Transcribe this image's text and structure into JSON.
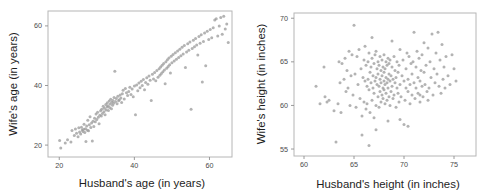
{
  "figure": {
    "kind": "two-panel-scatterplot-figure",
    "background": "#ffffff",
    "point_color": "#9a9a9a",
    "frame_color": "#b6b6b6",
    "tick_color": "#8f8f8f",
    "text_color": "#1d1d1d"
  },
  "chart_data": [
    {
      "type": "scatter",
      "panel": "left",
      "title": "",
      "xlabel": "Husband's age (in years)",
      "ylabel": "Wife's age (in years)",
      "xticks": [
        20,
        40,
        60
      ],
      "yticks": [
        20,
        40,
        60
      ],
      "xlim": [
        17,
        66
      ],
      "ylim": [
        16,
        65
      ],
      "grid": false,
      "legend": false,
      "n_points": 170,
      "x": [
        20.1,
        20.4,
        21.6,
        22.2,
        23.1,
        23.4,
        24.0,
        24.3,
        24.6,
        25.0,
        25.2,
        25.4,
        25.7,
        25.9,
        26.1,
        26.3,
        26.5,
        26.6,
        26.8,
        27.0,
        27.1,
        27.3,
        27.5,
        27.6,
        27.8,
        28.0,
        28.2,
        28.4,
        28.6,
        28.8,
        29.0,
        29.2,
        29.4,
        29.6,
        29.8,
        30.0,
        30.2,
        30.4,
        30.6,
        30.8,
        31.0,
        31.2,
        31.3,
        31.5,
        31.7,
        31.9,
        32.0,
        32.2,
        32.4,
        32.5,
        32.7,
        32.8,
        33.0,
        33.1,
        33.3,
        33.4,
        33.6,
        33.7,
        33.9,
        34.0,
        34.2,
        34.3,
        34.5,
        34.6,
        34.8,
        35.0,
        35.2,
        35.4,
        35.6,
        35.8,
        36.0,
        36.2,
        36.4,
        36.6,
        36.8,
        37.0,
        37.3,
        37.6,
        37.9,
        38.2,
        38.5,
        38.8,
        39.1,
        39.4,
        39.7,
        40.0,
        40.3,
        40.6,
        40.9,
        41.2,
        41.5,
        41.8,
        42.1,
        42.4,
        42.7,
        43.0,
        43.3,
        43.6,
        43.9,
        44.2,
        44.5,
        44.8,
        45.1,
        45.4,
        45.7,
        46.0,
        46.3,
        46.6,
        46.8,
        47.0,
        47.2,
        47.4,
        47.6,
        47.8,
        48.0,
        48.2,
        48.4,
        48.6,
        48.8,
        49.0,
        49.2,
        49.4,
        49.6,
        49.8,
        50.0,
        50.3,
        50.6,
        50.9,
        51.2,
        51.5,
        51.8,
        52.1,
        52.4,
        52.7,
        53.0,
        53.3,
        53.6,
        53.9,
        54.2,
        54.5,
        54.8,
        55.1,
        55.4,
        55.7,
        56.0,
        56.3,
        56.6,
        56.9,
        57.2,
        57.5,
        57.8,
        58.1,
        58.4,
        58.7,
        59.0,
        59.4,
        59.8,
        60.2,
        60.6,
        61.0,
        61.4,
        61.8,
        62.2,
        62.6,
        63.0,
        63.4,
        63.8,
        64.2,
        64.6,
        65.0
      ],
      "y": [
        21.5,
        19.0,
        20.7,
        21.8,
        21.0,
        24.9,
        23.2,
        25.4,
        24.0,
        22.8,
        25.8,
        24.4,
        23.7,
        26.0,
        25.1,
        24.6,
        25.3,
        27.0,
        24.2,
        25.5,
        21.2,
        26.4,
        25.0,
        28.3,
        24.8,
        26.8,
        29.5,
        25.9,
        27.4,
        21.4,
        28.0,
        26.2,
        29.0,
        27.8,
        30.4,
        28.6,
        31.0,
        29.3,
        27.2,
        30.0,
        31.5,
        29.8,
        32.0,
        30.6,
        33.0,
        31.2,
        32.4,
        30.2,
        33.6,
        31.8,
        32.8,
        34.2,
        33.2,
        31.6,
        34.8,
        32.6,
        33.8,
        35.4,
        32.2,
        34.4,
        33.4,
        35.0,
        34.0,
        36.0,
        44.8,
        34.6,
        35.6,
        33.9,
        36.4,
        34.9,
        35.2,
        36.8,
        35.8,
        34.3,
        37.2,
        38.4,
        35.5,
        39.0,
        37.6,
        36.6,
        38.0,
        39.4,
        37.0,
        38.8,
        36.2,
        39.8,
        30.2,
        40.2,
        38.2,
        40.8,
        39.2,
        41.4,
        40.0,
        42.0,
        38.6,
        41.0,
        42.6,
        40.4,
        43.2,
        41.8,
        35.0,
        43.8,
        42.2,
        44.4,
        41.6,
        45.0,
        42.8,
        45.6,
        43.4,
        46.2,
        44.0,
        46.8,
        44.6,
        47.4,
        45.2,
        40.6,
        48.0,
        45.8,
        48.6,
        46.4,
        49.2,
        47.0,
        44.2,
        49.8,
        47.6,
        50.4,
        48.2,
        51.0,
        48.8,
        51.6,
        49.4,
        52.2,
        50.0,
        52.8,
        50.6,
        53.4,
        46.0,
        51.2,
        54.0,
        51.8,
        54.6,
        32.0,
        52.4,
        55.2,
        53.0,
        55.8,
        53.6,
        50.2,
        56.4,
        54.2,
        57.0,
        41.2,
        54.8,
        57.6,
        46.6,
        58.2,
        55.4,
        58.8,
        56.0,
        59.4,
        62.0,
        62.4,
        56.6,
        60.0,
        62.8,
        57.2,
        63.2,
        59.0,
        60.6,
        54.4
      ]
    },
    {
      "type": "scatter",
      "panel": "right",
      "title": "",
      "xlabel": "Husband's height (in inches)",
      "ylabel": "Wife's height (in inches)",
      "xticks": [
        60,
        65,
        70,
        75
      ],
      "yticks": [
        55,
        60,
        65,
        70
      ],
      "xlim": [
        59.0,
        77.2
      ],
      "ylim": [
        54.2,
        70.6
      ],
      "grid": false,
      "legend": false,
      "n_points": 195,
      "x": [
        61.2,
        61.6,
        62.0,
        62.1,
        62.3,
        62.5,
        63.0,
        63.2,
        63.4,
        63.5,
        63.6,
        63.8,
        64.0,
        64.1,
        64.2,
        64.3,
        64.4,
        64.5,
        64.6,
        64.7,
        64.8,
        64.9,
        65.0,
        65.1,
        65.2,
        65.3,
        65.4,
        65.5,
        65.6,
        65.7,
        65.8,
        65.9,
        66.0,
        66.0,
        66.1,
        66.1,
        66.2,
        66.2,
        66.3,
        66.3,
        66.4,
        66.4,
        66.5,
        66.5,
        66.6,
        66.6,
        66.7,
        66.7,
        66.8,
        66.8,
        66.9,
        66.9,
        67.0,
        67.0,
        67.0,
        67.1,
        67.1,
        67.2,
        67.2,
        67.2,
        67.3,
        67.3,
        67.4,
        67.4,
        67.4,
        67.5,
        67.5,
        67.5,
        67.6,
        67.6,
        67.6,
        67.7,
        67.7,
        67.7,
        67.8,
        67.8,
        67.8,
        67.9,
        67.9,
        67.9,
        68.0,
        68.0,
        68.0,
        68.0,
        68.1,
        68.1,
        68.1,
        68.2,
        68.2,
        68.2,
        68.3,
        68.3,
        68.3,
        68.4,
        68.4,
        68.4,
        68.5,
        68.5,
        68.5,
        68.6,
        68.6,
        68.6,
        68.7,
        68.7,
        68.8,
        68.8,
        68.9,
        68.9,
        69.0,
        69.0,
        69.1,
        69.1,
        69.2,
        69.2,
        69.3,
        69.3,
        69.4,
        69.4,
        69.5,
        69.5,
        69.6,
        69.6,
        69.7,
        69.8,
        69.9,
        70.0,
        70.0,
        70.1,
        70.2,
        70.2,
        70.3,
        70.4,
        70.4,
        70.5,
        70.6,
        70.6,
        70.7,
        70.8,
        70.8,
        70.9,
        71.0,
        71.0,
        71.1,
        71.2,
        71.2,
        71.3,
        71.4,
        71.4,
        71.5,
        71.6,
        71.6,
        71.7,
        71.8,
        71.8,
        71.9,
        72.0,
        72.0,
        72.1,
        72.2,
        72.3,
        72.4,
        72.5,
        72.6,
        72.7,
        72.8,
        72.9,
        73.0,
        73.1,
        73.2,
        73.3,
        73.4,
        73.5,
        73.6,
        73.7,
        73.8,
        73.9,
        74.0,
        74.1,
        74.2,
        74.4,
        74.6,
        74.8,
        75.0,
        75.2,
        66.5,
        65.8,
        67.2,
        68.4,
        69.6,
        70.4,
        63.7,
        66.8,
        68.8,
        71.6,
        72.4
      ],
      "y": [
        62.2,
        60.2,
        64.4,
        61.0,
        60.4,
        60.6,
        59.4,
        55.8,
        60.2,
        65.0,
        62.6,
        64.8,
        63.0,
        65.4,
        61.6,
        64.0,
        62.0,
        66.2,
        60.0,
        63.4,
        65.8,
        61.2,
        69.2,
        63.6,
        59.8,
        65.6,
        62.4,
        66.4,
        60.8,
        64.2,
        58.8,
        63.2,
        65.2,
        60.4,
        62.8,
        66.8,
        59.6,
        64.6,
        62.2,
        60.2,
        65.0,
        63.0,
        61.8,
        66.0,
        59.2,
        63.8,
        62.6,
        64.4,
        60.6,
        65.4,
        62.0,
        63.4,
        58.6,
        61.4,
        64.8,
        62.8,
        65.8,
        60.0,
        63.2,
        66.2,
        62.4,
        64.2,
        61.0,
        63.6,
        65.0,
        59.8,
        62.2,
        64.6,
        61.6,
        63.0,
        65.6,
        62.6,
        64.0,
        60.4,
        63.4,
        61.2,
        65.2,
        62.0,
        64.4,
        60.8,
        62.8,
        63.8,
        61.8,
        65.8,
        62.4,
        64.2,
        60.2,
        63.2,
        65.0,
        61.4,
        62.6,
        64.6,
        60.6,
        63.0,
        65.4,
        62.0,
        61.0,
        63.6,
        64.8,
        62.8,
        60.0,
        65.2,
        61.6,
        63.4,
        62.2,
        64.4,
        60.8,
        63.0,
        61.2,
        65.6,
        62.6,
        64.0,
        59.8,
        63.2,
        62.0,
        65.0,
        61.4,
        63.8,
        60.4,
        64.6,
        62.4,
        66.4,
        61.0,
        63.4,
        65.2,
        57.8,
        62.8,
        60.6,
        64.2,
        62.0,
        66.0,
        61.6,
        63.0,
        65.6,
        62.4,
        60.2,
        64.8,
        61.2,
        63.6,
        65.0,
        62.6,
        68.4,
        60.8,
        64.4,
        62.0,
        66.2,
        61.4,
        63.2,
        65.4,
        62.8,
        60.4,
        64.0,
        62.2,
        65.8,
        61.0,
        63.8,
        67.2,
        62.4,
        64.6,
        61.6,
        66.6,
        62.0,
        65.0,
        63.2,
        68.2,
        61.2,
        64.2,
        62.6,
        66.0,
        63.6,
        68.4,
        62.2,
        65.2,
        61.4,
        67.0,
        63.0,
        64.4,
        62.0,
        65.6,
        63.4,
        62.4,
        65.8,
        64.2,
        62.8,
        55.4,
        56.6,
        57.2,
        58.2,
        58.4,
        57.6,
        59.2,
        67.8,
        67.4,
        61.2,
        60.6
      ]
    }
  ]
}
